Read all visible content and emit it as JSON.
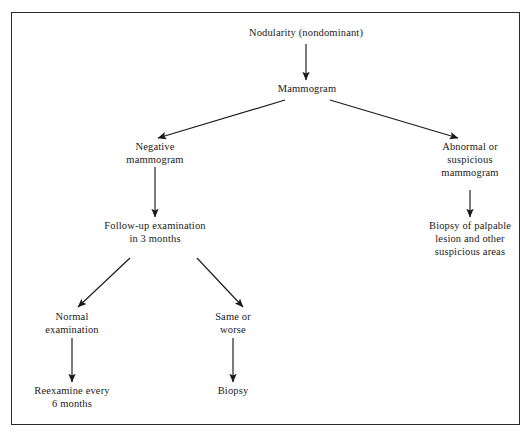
{
  "figure": {
    "border_color": "#2b2b2b",
    "text_color": "#1a1a1a",
    "background": "#ffffff"
  },
  "nodes": {
    "nodularity": {
      "lines": [
        "Nodularity (nondominant)"
      ],
      "cx": 306,
      "top_y": 36
    },
    "mammogram": {
      "lines": [
        "Mammogram"
      ],
      "cx": 307,
      "top_y": 92
    },
    "negative_mammogram": {
      "lines": [
        "Negative",
        "mammogram"
      ],
      "cx": 155,
      "top_y": 150
    },
    "abnormal_mammogram": {
      "lines": [
        "Abnormal or",
        "suspicious",
        "mammogram"
      ],
      "cx": 470,
      "top_y": 150
    },
    "followup": {
      "lines": [
        "Follow-up examination",
        "in 3 months"
      ],
      "cx": 155,
      "top_y": 229
    },
    "biopsy_palpable": {
      "lines": [
        "Biopsy of palpable",
        "lesion and other",
        "suspicious areas"
      ],
      "cx": 470,
      "top_y": 229
    },
    "normal_exam": {
      "lines": [
        "Normal",
        "examination"
      ],
      "cx": 72,
      "top_y": 320
    },
    "same_or_worse": {
      "lines": [
        "Same or",
        "worse"
      ],
      "cx": 233,
      "top_y": 320
    },
    "reexamine": {
      "lines": [
        "Reexamine every",
        "6 months"
      ],
      "cx": 72,
      "top_y": 394
    },
    "biopsy": {
      "lines": [
        "Biopsy"
      ],
      "cx": 233,
      "top_y": 394
    }
  },
  "edges": [
    {
      "name": "nodularity-to-mammogram",
      "from": "nodularity",
      "to": "mammogram",
      "d": "M 306 44 L 306 80"
    },
    {
      "name": "mammogram-to-negative",
      "from": "mammogram",
      "to": "negative_mammogram",
      "d": "M 285 100 L 158 138"
    },
    {
      "name": "mammogram-to-abnormal",
      "from": "mammogram",
      "to": "abnormal_mammogram",
      "d": "M 330 100 L 458 138"
    },
    {
      "name": "negative-to-followup",
      "from": "negative_mammogram",
      "to": "followup",
      "d": "M 155 167 L 155 217"
    },
    {
      "name": "abnormal-to-biopsy-palpable",
      "from": "abnormal_mammogram",
      "to": "biopsy_palpable",
      "d": "M 470 190 L 470 217"
    },
    {
      "name": "followup-to-normal",
      "from": "followup",
      "to": "normal_exam",
      "d": "M 130 258 L 78 307"
    },
    {
      "name": "followup-to-same-or-worse",
      "from": "followup",
      "to": "same_or_worse",
      "d": "M 197 258 L 243 307"
    },
    {
      "name": "normal-to-reexamine",
      "from": "normal_exam",
      "to": "reexamine",
      "d": "M 72 338 L 72 382"
    },
    {
      "name": "same-or-worse-to-biopsy",
      "from": "same_or_worse",
      "to": "biopsy",
      "d": "M 233 338 L 233 382"
    }
  ],
  "style": {
    "font_size_px": 10.5,
    "line_height_px": 13,
    "stroke_width_px": 1.15
  }
}
